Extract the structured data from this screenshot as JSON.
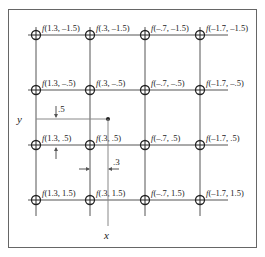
{
  "figure": {
    "colors": {
      "line": "#555555",
      "frame": "#666666",
      "text": "#222222",
      "guide": "#888888"
    },
    "columns_x": [
      "1.3",
      ".3",
      "-.7",
      "-1.7"
    ],
    "rows_y": [
      "-1.5",
      "-.5",
      ".5",
      "1.5"
    ],
    "labels": [
      [
        "f(1.3, –1.5)",
        "f(.3, –1.5)",
        "f(–.7, –1.5)",
        "f(–1.7, –1.5)"
      ],
      [
        "f(1.3, –.5)",
        "f(.3, –.5)",
        "f(–.7, –.5)",
        "f(–1.7, –.5)"
      ],
      [
        "f(1.3, .5)",
        "f(.3, .5)",
        "f(–.7, .5)",
        "f(–1.7, .5)"
      ],
      [
        "f(1.3, 1.5)",
        "f(.3, 1.5)",
        "f(–.7, 1.5)",
        "f(–1.7, 1.5)"
      ]
    ],
    "axes": {
      "y_label": "y",
      "x_label": "x"
    },
    "offsets": {
      "vertical_offset": ".5",
      "horizontal_offset": ".3"
    }
  }
}
